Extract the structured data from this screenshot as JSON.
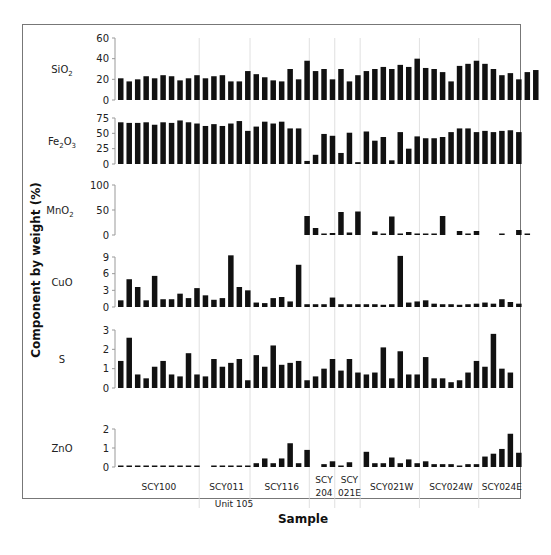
{
  "chart_data": {
    "type": "bar",
    "title": "",
    "xlabel": "Sample",
    "ylabel": "Component by weight (%)",
    "grid": false,
    "group_separators": true,
    "groups": [
      {
        "label": "SCY100",
        "start": 0,
        "end": 9
      },
      {
        "label": "SCY011",
        "start": 10,
        "end": 15
      },
      {
        "label": "SCY116",
        "start": 16,
        "end": 22
      },
      {
        "label": "SCY 204",
        "start": 23,
        "end": 25
      },
      {
        "label": "SCY 021E",
        "start": 26,
        "end": 28
      },
      {
        "label": "SCY021W",
        "start": 29,
        "end": 35
      },
      {
        "label": "SCY024W",
        "start": 36,
        "end": 42
      },
      {
        "label": "SCY024E",
        "start": 43,
        "end": 47
      }
    ],
    "annotation": "Unit 105",
    "panels": [
      {
        "name": "SiO2",
        "label": "SiO",
        "sub": "2",
        "ylim": [
          0,
          60
        ],
        "ticks": [
          0,
          20,
          40,
          60
        ],
        "values": [
          21,
          18,
          20,
          23,
          21,
          24,
          23,
          19,
          21,
          24,
          21,
          23,
          24,
          18,
          18,
          28,
          25,
          22,
          19,
          18,
          30,
          20,
          38,
          28,
          30,
          20,
          30,
          18,
          24,
          28,
          30,
          32,
          30,
          34,
          32,
          40,
          31,
          30,
          27,
          18,
          33,
          35,
          38,
          35,
          30,
          24,
          26,
          20,
          27,
          29
        ]
      },
      {
        "name": "Fe2O3",
        "label": "Fe",
        "sub2": "2",
        "labelMid": "O",
        "sub": "3",
        "ylim": [
          0,
          75
        ],
        "ticks": [
          0,
          25,
          50,
          75
        ],
        "values": [
          68,
          67,
          67,
          68,
          64,
          68,
          67,
          71,
          68,
          66,
          62,
          65,
          62,
          66,
          70,
          54,
          61,
          69,
          66,
          69,
          58,
          58,
          5,
          15,
          49,
          46,
          18,
          51,
          3,
          53,
          38,
          44,
          6,
          52,
          25,
          45,
          42,
          42,
          44,
          52,
          58,
          58,
          52,
          54,
          52,
          54,
          55,
          52
        ]
      },
      {
        "name": "MnO2",
        "label": "MnO",
        "sub": "2",
        "ylim": [
          0,
          100
        ],
        "ticks": [
          0,
          50,
          100
        ],
        "values": [
          null,
          null,
          null,
          null,
          null,
          null,
          null,
          null,
          null,
          null,
          null,
          null,
          null,
          null,
          null,
          null,
          null,
          null,
          null,
          null,
          null,
          null,
          38,
          14,
          2,
          4,
          46,
          5,
          47,
          null,
          7,
          1,
          37,
          1,
          6,
          2,
          2,
          1,
          38,
          null,
          8,
          2,
          8,
          null,
          null,
          1,
          null,
          10,
          1
        ]
      },
      {
        "name": "CuO",
        "label": "CuO",
        "sub": "",
        "ylim": [
          0,
          9
        ],
        "ticks": [
          0,
          3,
          6,
          9
        ],
        "values": [
          1.2,
          5.0,
          3.6,
          1.2,
          5.6,
          1.4,
          1.4,
          2.4,
          1.6,
          3.4,
          2.1,
          1.3,
          1.6,
          9.3,
          3.6,
          3.0,
          0.8,
          0.7,
          1.6,
          1.8,
          1.0,
          7.6,
          0.5,
          0.5,
          0.5,
          1.7,
          0.5,
          0.5,
          0.5,
          0.5,
          0.5,
          0.4,
          0.5,
          9.2,
          0.8,
          1.0,
          1.2,
          0.6,
          0.5,
          0.5,
          0.4,
          0.5,
          0.6,
          0.8,
          0.6,
          1.4,
          0.9,
          0.6
        ]
      },
      {
        "name": "S",
        "label": "S",
        "sub": "",
        "ylim": [
          0,
          3
        ],
        "ticks": [
          0,
          1,
          2,
          3
        ],
        "values": [
          1.4,
          2.6,
          0.7,
          0.5,
          1.1,
          1.4,
          0.7,
          0.6,
          1.8,
          0.7,
          0.6,
          1.5,
          1.1,
          1.3,
          1.5,
          0.4,
          1.7,
          1.1,
          2.2,
          1.2,
          1.3,
          1.4,
          0.4,
          0.6,
          1.0,
          1.5,
          0.9,
          1.5,
          0.8,
          0.7,
          0.8,
          2.1,
          0.5,
          1.9,
          0.7,
          0.7,
          1.6,
          0.5,
          0.5,
          0.3,
          0.4,
          0.8,
          1.4,
          1.1,
          2.8,
          1.0,
          0.8
        ]
      },
      {
        "name": "ZnO",
        "label": "ZnO",
        "sub": "",
        "ylim": [
          0,
          2
        ],
        "ticks": [
          0,
          1,
          2
        ],
        "values": [
          0.02,
          0.02,
          0.02,
          0.02,
          0.02,
          0.02,
          0.02,
          0.02,
          0.02,
          0.02,
          null,
          0.02,
          0.02,
          0.03,
          0.02,
          0.02,
          0.2,
          0.45,
          0.2,
          0.45,
          1.25,
          0.2,
          0.9,
          null,
          0.15,
          0.3,
          0.05,
          0.25,
          null,
          0.8,
          0.2,
          0.2,
          0.5,
          0.2,
          0.4,
          0.2,
          0.3,
          0.15,
          0.15,
          0.15,
          0.05,
          0.15,
          0.15,
          0.55,
          0.7,
          0.95,
          1.75,
          0.75
        ]
      }
    ]
  },
  "labels": {
    "sio2": "SiO",
    "fe2o3_a": "Fe",
    "fe2o3_b": "O",
    "mno2": "MnO",
    "cuo": "CuO",
    "s": "S",
    "zno": "ZnO",
    "sub2": "2",
    "sub3": "3"
  }
}
